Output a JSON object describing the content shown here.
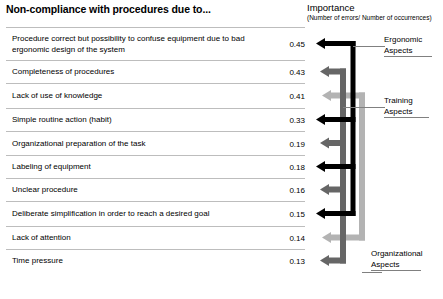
{
  "header": {
    "title": "Non-compliance with procedures due to...",
    "importance_label": "Importance",
    "importance_sublabel": "(Number of errors/ Number of occurrences)"
  },
  "colors": {
    "ergonomic": "#000000",
    "training": "#666666",
    "organizational": "#b3b3b3",
    "rule": "#bdbdbd",
    "text": "#000000",
    "background": "#ffffff"
  },
  "chart_data": {
    "type": "bar",
    "title": "Non-compliance with procedures due to...",
    "xlabel": "Importance (Number of errors/ Number of occurrences)",
    "ylabel": "",
    "categories": [
      "Procedure correct but possibility to confuse equipment due to bad ergonomic design of the system",
      "Completeness of procedures",
      "Lack of use of knowledge",
      "Simple routine action (habit)",
      "Organizational preparation of the task",
      "Labeling of equipment",
      "Unclear procedure",
      "Deliberate simplification in order to reach a desired goal",
      "Lack of attention",
      "Time pressure"
    ],
    "values": [
      0.45,
      0.43,
      0.41,
      0.33,
      0.19,
      0.18,
      0.16,
      0.15,
      0.14,
      0.13
    ],
    "grid": false,
    "legend_position": "right",
    "legend": [
      "Ergonomic Aspects",
      "Training Aspects",
      "Organizational Aspects"
    ]
  },
  "rows": [
    {
      "label": "Procedure correct but possibility to confuse equipment due to bad ergonomic design of the system",
      "value": "0.45",
      "group": "ergonomic"
    },
    {
      "label": "Completeness of procedures",
      "value": "0.43",
      "group": "training"
    },
    {
      "label": "Lack of use of knowledge",
      "value": "0.41",
      "group": "organizational"
    },
    {
      "label": "Simple routine action (habit)",
      "value": "0.33",
      "group": "ergonomic"
    },
    {
      "label": "Organizational preparation of the task",
      "value": "0.19",
      "group": "training"
    },
    {
      "label": "Labeling of equipment",
      "value": "0.18",
      "group": "ergonomic"
    },
    {
      "label": "Unclear procedure",
      "value": "0.16",
      "group": "training"
    },
    {
      "label": "Deliberate simplification in order to reach a desired goal",
      "value": "0.15",
      "group": "ergonomic"
    },
    {
      "label": "Lack of attention",
      "value": "0.14",
      "group": "organizational"
    },
    {
      "label": "Time pressure",
      "value": "0.13",
      "group": "training"
    }
  ],
  "groups": [
    {
      "id": "ergonomic",
      "line1": "Ergonomic",
      "line2": "Aspects"
    },
    {
      "id": "training",
      "line1": "Training",
      "line2": "Aspects"
    },
    {
      "id": "organizational",
      "line1": "Organizational",
      "line2": "Aspects"
    }
  ]
}
